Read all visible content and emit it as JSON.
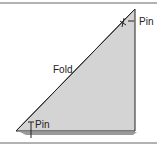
{
  "diagram": {
    "labels": {
      "fold": "Fold",
      "pin_top": "Pin",
      "pin_bottom": "Pin"
    },
    "colors": {
      "fill": "#d4d4d4",
      "line": "#222222",
      "shadow": "#9a9a9a",
      "rule": "#666666"
    }
  }
}
